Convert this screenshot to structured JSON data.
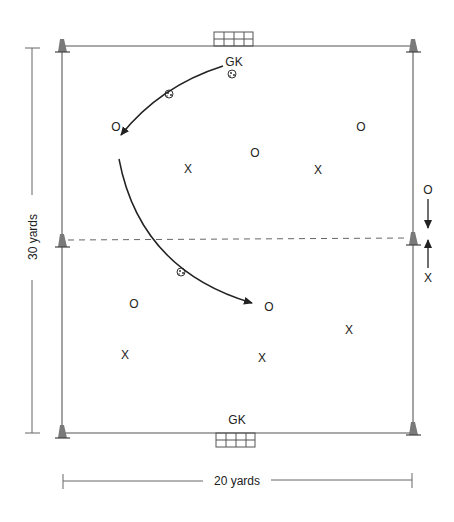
{
  "colors": {
    "line": "#555555",
    "dark": "#222222",
    "cone": "#7a7a7a",
    "background": "#ffffff"
  },
  "field": {
    "top_goalkeeper": "GK",
    "bottom_goalkeeper": "GK",
    "width_label": "20 yards",
    "length_label": "30 yards"
  },
  "players": {
    "o_symbol": "O",
    "x_symbol": "X",
    "offense": [
      {
        "x": 116,
        "y": 127
      },
      {
        "x": 255,
        "y": 153
      },
      {
        "x": 361,
        "y": 127
      },
      {
        "x": 134,
        "y": 304
      },
      {
        "x": 269,
        "y": 307
      }
    ],
    "defense": [
      {
        "x": 188,
        "y": 169
      },
      {
        "x": 318,
        "y": 170
      },
      {
        "x": 125,
        "y": 355
      },
      {
        "x": 262,
        "y": 358
      },
      {
        "x": 349,
        "y": 330
      }
    ]
  },
  "side_rotation": {
    "top_label": "O",
    "bottom_label": "X"
  }
}
